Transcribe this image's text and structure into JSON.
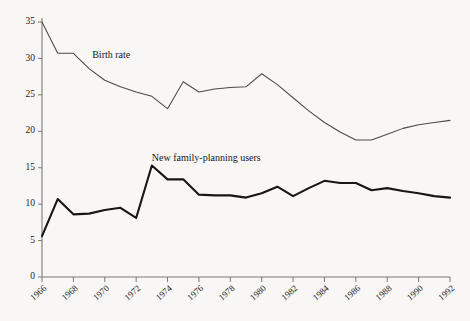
{
  "chart_data": {
    "type": "line",
    "title": "",
    "xlabel": "",
    "ylabel": "",
    "xlim": [
      1966,
      1992
    ],
    "ylim": [
      0,
      35
    ],
    "grid": false,
    "legend": "inline-annotations",
    "x": [
      1966,
      1967,
      1968,
      1969,
      1970,
      1971,
      1972,
      1973,
      1974,
      1975,
      1976,
      1977,
      1978,
      1979,
      1980,
      1981,
      1982,
      1983,
      1984,
      1985,
      1986,
      1987,
      1988,
      1989,
      1990,
      1991,
      1992
    ],
    "xtick_labels": [
      "1966",
      "1968",
      "1970",
      "1972",
      "1974",
      "1976",
      "1978",
      "1980",
      "1982",
      "1984",
      "1986",
      "1988",
      "1990",
      "1992"
    ],
    "xtick_values": [
      1966,
      1968,
      1970,
      1972,
      1974,
      1976,
      1978,
      1980,
      1982,
      1984,
      1986,
      1988,
      1990,
      1992
    ],
    "ytick_labels": [
      "0",
      "5",
      "10",
      "15",
      "20",
      "25",
      "30",
      "35"
    ],
    "ytick_values": [
      0,
      5,
      10,
      15,
      20,
      25,
      30,
      35
    ],
    "series": [
      {
        "name": "Birth rate",
        "label": "Birth rate",
        "label_x": 1969.2,
        "label_y": 30.4,
        "color": "#4a4a48",
        "width": 1.05,
        "values": [
          35.0,
          30.7,
          30.7,
          28.6,
          27.0,
          26.1,
          25.4,
          24.8,
          23.1,
          26.8,
          25.4,
          25.8,
          26.0,
          26.1,
          27.9,
          26.4,
          24.6,
          22.8,
          21.2,
          19.9,
          18.8,
          18.8,
          19.6,
          20.4,
          20.9,
          21.2,
          21.5
        ]
      },
      {
        "name": "New family-planning users",
        "label": "New family-planning users",
        "label_x": 1973.0,
        "label_y": 16.3,
        "color": "#161616",
        "width": 2.1,
        "values": [
          5.6,
          10.7,
          8.6,
          8.7,
          9.2,
          9.5,
          8.1,
          15.3,
          13.4,
          13.4,
          11.3,
          11.2,
          11.2,
          10.9,
          11.5,
          12.4,
          11.1,
          12.2,
          13.2,
          12.9,
          12.9,
          11.9,
          12.2,
          11.8,
          11.5,
          11.1,
          10.9
        ]
      }
    ]
  }
}
